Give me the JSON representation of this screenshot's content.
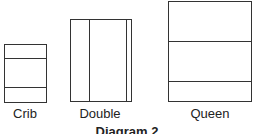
{
  "diagram": {
    "caption": "Diagram 2",
    "beds": [
      {
        "name": "Crib"
      },
      {
        "name": "Double"
      },
      {
        "name": "Queen"
      }
    ]
  }
}
